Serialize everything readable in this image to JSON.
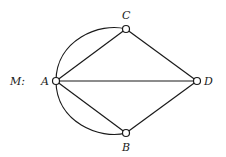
{
  "graph": {
    "name_label": "M:",
    "nodes": [
      {
        "id": "A",
        "label": "A",
        "x": 56,
        "y": 81
      },
      {
        "id": "B",
        "label": "B",
        "x": 126,
        "y": 133
      },
      {
        "id": "C",
        "label": "C",
        "x": 126,
        "y": 29
      },
      {
        "id": "D",
        "label": "D",
        "x": 197,
        "y": 81
      }
    ],
    "edges": [
      {
        "from": "A",
        "to": "C",
        "type": "straight"
      },
      {
        "from": "A",
        "to": "C",
        "type": "curved"
      },
      {
        "from": "A",
        "to": "B",
        "type": "straight"
      },
      {
        "from": "A",
        "to": "B",
        "type": "curved"
      },
      {
        "from": "A",
        "to": "D",
        "type": "straight"
      },
      {
        "from": "C",
        "to": "D",
        "type": "straight"
      },
      {
        "from": "B",
        "to": "D",
        "type": "straight"
      }
    ],
    "colors": {
      "stroke": "#1a1a1a",
      "node_fill": "#ffffff"
    }
  }
}
